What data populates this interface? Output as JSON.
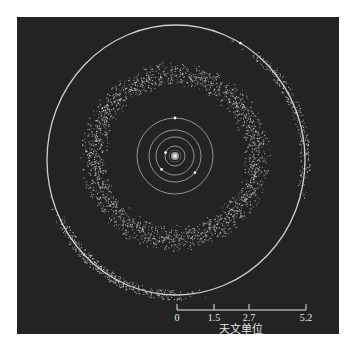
{
  "figure": {
    "background_color": "#232323",
    "orbit_color": "#cfcfcf",
    "asteroid_color": "#e0e0e0",
    "sun": {
      "cx": 175,
      "cy": 156,
      "label": ""
    },
    "orbits": [
      {
        "name": "mercury",
        "rx": 10,
        "ry": 10
      },
      {
        "name": "venus",
        "rx": 19,
        "ry": 19
      },
      {
        "name": "earth",
        "rx": 26,
        "ry": 26
      },
      {
        "name": "mars",
        "rx": 38,
        "ry": 38
      },
      {
        "name": "jupiter",
        "rx": 129,
        "ry": 135
      }
    ],
    "planets": [
      {
        "name": "mercury",
        "angle": 200
      },
      {
        "name": "venus",
        "angle": 135
      },
      {
        "name": "earth",
        "angle": 40
      },
      {
        "name": "mars",
        "angle": 270
      },
      {
        "name": "jupiter",
        "angle": 300
      }
    ],
    "belt": {
      "inner_r": 68,
      "outer_r": 96,
      "count": 2200
    },
    "trojans": [
      {
        "name": "L4",
        "center_angle": 120,
        "spread": 40,
        "count": 380
      },
      {
        "name": "L5",
        "center_angle": 340,
        "spread": 40,
        "count": 260
      }
    ]
  },
  "scale_bar": {
    "unit_label": "天文单位",
    "ticks": [
      {
        "label": "0",
        "x": 177
      },
      {
        "label": "1.5",
        "x": 214
      },
      {
        "label": "2.7",
        "x": 249
      },
      {
        "label": "5.2",
        "x": 306
      }
    ]
  }
}
